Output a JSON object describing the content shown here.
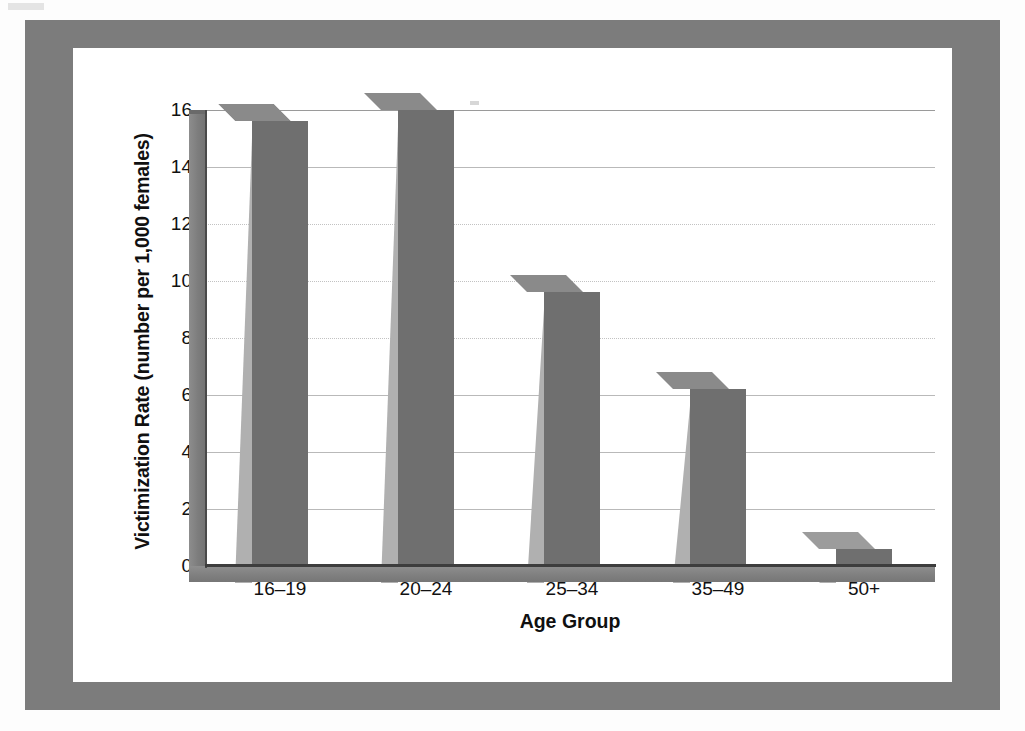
{
  "figure": {
    "frame_color": "#7c7c7c",
    "background_color": "#ffffff"
  },
  "chart_data": {
    "type": "bar",
    "title": "",
    "subtitle": "",
    "xlabel": "Age Group",
    "ylabel": "Victimization Rate (number per 1,000 females)",
    "categories": [
      "16–19",
      "20–24",
      "25–34",
      "35–49",
      "50+"
    ],
    "values": [
      15.6,
      16.0,
      9.6,
      6.2,
      0.6
    ],
    "ylim": [
      0,
      16
    ],
    "ytick_labels": [
      "16",
      "14",
      "12",
      "10",
      "8",
      "6",
      "4",
      "2",
      "0"
    ],
    "ytick_values": [
      16,
      14,
      12,
      10,
      8,
      6,
      4,
      2,
      0
    ],
    "grid": true,
    "legend": null,
    "style": "3d-column",
    "bar_front_color": "#6f6f6f",
    "bar_side_color": "#b0b0b0",
    "bar_top_color": "#8a8a8a",
    "gridline_color": "#b9b9b9",
    "axis_color": "#3d3d3d"
  }
}
